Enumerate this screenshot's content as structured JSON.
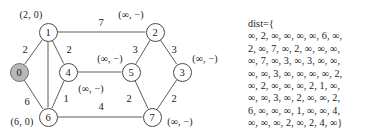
{
  "figure": {
    "type": "weighted-undirected-graph-with-dijkstra-labels",
    "source_node": "0"
  },
  "graph": {
    "nodes": [
      {
        "id": "n0",
        "label": "0",
        "x": 19,
        "y": 72,
        "highlighted": true,
        "dist_label": "(6, 0)",
        "dist_label_x": 22,
        "dist_label_y": 121
      },
      {
        "id": "n1",
        "label": "1",
        "x": 48,
        "y": 32,
        "highlighted": false,
        "dist_label": "(2, 0)",
        "dist_label_x": 31,
        "dist_label_y": 14
      },
      {
        "id": "n2",
        "label": "2",
        "x": 155,
        "y": 32,
        "highlighted": false,
        "dist_label": "(∞, −)",
        "dist_label_x": 131,
        "dist_label_y": 14
      },
      {
        "id": "n3",
        "label": "3",
        "x": 182,
        "y": 72,
        "highlighted": false,
        "dist_label": "(∞, −)",
        "dist_label_x": 205,
        "dist_label_y": 58
      },
      {
        "id": "n4",
        "label": "4",
        "x": 68,
        "y": 72,
        "highlighted": false,
        "dist_label": "(∞, −)",
        "dist_label_x": 91,
        "dist_label_y": 88
      },
      {
        "id": "n5",
        "label": "5",
        "x": 131,
        "y": 72,
        "highlighted": false,
        "dist_label": "(∞, −)",
        "dist_label_x": 110,
        "dist_label_y": 58
      },
      {
        "id": "n6",
        "label": "6",
        "x": 48,
        "y": 117,
        "highlighted": false,
        "dist_label": "",
        "dist_label_x": 0,
        "dist_label_y": 0
      },
      {
        "id": "n7",
        "label": "7",
        "x": 152,
        "y": 117,
        "highlighted": false,
        "dist_label": "(∞, −)",
        "dist_label_x": 180,
        "dist_label_y": 121
      }
    ],
    "edges": [
      {
        "from": "n0",
        "to": "n1",
        "weight": "2",
        "label_x": 25,
        "label_y": 49
      },
      {
        "from": "n0",
        "to": "n6",
        "weight": "6",
        "label_x": 27,
        "label_y": 101
      },
      {
        "from": "n1",
        "to": "n2",
        "weight": "7",
        "label_x": 101,
        "label_y": 22
      },
      {
        "from": "n1",
        "to": "n4",
        "weight": "2",
        "label_x": 69,
        "label_y": 49
      },
      {
        "from": "n1",
        "to": "n6",
        "weight": "",
        "label_x": 0,
        "label_y": 0
      },
      {
        "from": "n2",
        "to": "n5",
        "weight": "3",
        "label_x": 135,
        "label_y": 49
      },
      {
        "from": "n2",
        "to": "n3",
        "weight": "3",
        "label_x": 174,
        "label_y": 49
      },
      {
        "from": "n3",
        "to": "n7",
        "weight": "2",
        "label_x": 174,
        "label_y": 98
      },
      {
        "from": "n4",
        "to": "n5",
        "weight": "",
        "label_x": 0,
        "label_y": 0
      },
      {
        "from": "n4",
        "to": "n6",
        "weight": "1",
        "label_x": 66,
        "label_y": 98
      },
      {
        "from": "n5",
        "to": "n7",
        "weight": "2",
        "label_x": 129,
        "label_y": 98
      },
      {
        "from": "n6",
        "to": "n7",
        "weight": "4",
        "label_x": 101,
        "label_y": 106
      }
    ]
  },
  "dist": {
    "header": "dist={",
    "rows": [
      "∞, 2, ∞, ∞, ∞, ∞, 6, ∞,",
      "2, ∞, 7, ∞, 2, ∞, ∞, ∞,",
      "∞, 7, ∞, 3, ∞, 3, ∞, ∞,",
      "∞, ∞, 3, ∞, ∞, ∞, ∞, 2,",
      "∞, 2, ∞, ∞, ∞, 2, 1, ∞,",
      "∞, ∞, 3, ∞, 2, ∞, ∞, 2,",
      "6, ∞, ∞, ∞, 1, ∞, ∞, 4,",
      "∞, ∞, ∞, 2, ∞, 2, 4, ∞}"
    ],
    "matrix": [
      [
        "∞",
        "2",
        "∞",
        "∞",
        "∞",
        "∞",
        "6",
        "∞"
      ],
      [
        "2",
        "∞",
        "7",
        "∞",
        "2",
        "∞",
        "∞",
        "∞"
      ],
      [
        "∞",
        "7",
        "∞",
        "3",
        "∞",
        "3",
        "∞",
        "∞"
      ],
      [
        "∞",
        "∞",
        "3",
        "∞",
        "∞",
        "∞",
        "∞",
        "2"
      ],
      [
        "∞",
        "2",
        "∞",
        "∞",
        "∞",
        "2",
        "1",
        "∞"
      ],
      [
        "∞",
        "∞",
        "3",
        "∞",
        "2",
        "∞",
        "∞",
        "2"
      ],
      [
        "6",
        "∞",
        "∞",
        "∞",
        "1",
        "∞",
        "∞",
        "4"
      ],
      [
        "∞",
        "∞",
        "∞",
        "2",
        "∞",
        "2",
        "4",
        "∞"
      ]
    ]
  },
  "colors": {
    "stroke": "#4a4a4a",
    "source_fill": "#b8b8b8",
    "text": "#1a1a1a",
    "background": "#ffffff"
  }
}
